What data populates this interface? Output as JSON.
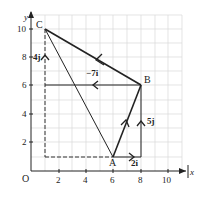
{
  "diagram": {
    "type": "vector-diagram",
    "axes": {
      "x_label": "x",
      "y_label": "y",
      "origin_label": "O",
      "x_ticks": [
        "2",
        "4",
        "6",
        "8",
        "10"
      ],
      "y_ticks": [
        "2",
        "4",
        "6",
        "8",
        "10"
      ]
    },
    "points": {
      "A": {
        "label": "A",
        "x": 6,
        "y": 1
      },
      "B": {
        "label": "B",
        "x": 8,
        "y": 6
      },
      "C": {
        "label": "C",
        "x": 1,
        "y": 10
      }
    },
    "vector_labels": {
      "ab_i": "2i",
      "ab_j": "5j",
      "bc_i": "−7i",
      "bc_j": "4j"
    },
    "colors": {
      "line": "#222222",
      "grid": "#d8d8d8"
    }
  }
}
